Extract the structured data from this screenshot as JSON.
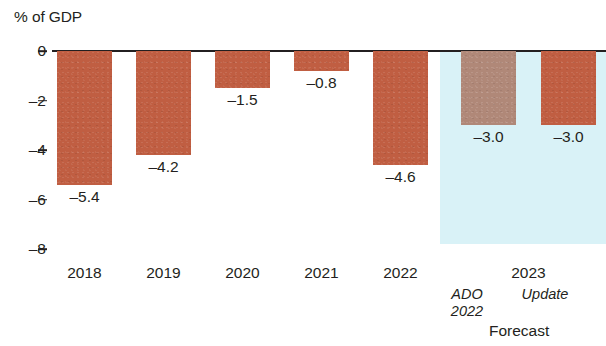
{
  "chart_data": {
    "type": "bar",
    "title": "",
    "ylabel": "% of GDP",
    "xlabel": "",
    "ylim": [
      -8,
      0
    ],
    "grid": false,
    "legend_position": "none",
    "categories": [
      "2018",
      "2019",
      "2020",
      "2021",
      "2022",
      "2023 ADO 2022",
      "2023 Update"
    ],
    "values": [
      -5.4,
      -4.2,
      -1.5,
      -0.8,
      -4.6,
      -3.0,
      -3.0
    ],
    "value_labels": [
      "–5.4",
      "–4.2",
      "–1.5",
      "–0.8",
      "–4.6",
      "–3.0",
      "–3.0"
    ],
    "y_ticks": [
      0,
      -2,
      -4,
      -6,
      -8
    ],
    "y_tick_labels": [
      "0",
      "–2",
      "–4",
      "–6",
      "–8"
    ],
    "bars": [
      {
        "category": "2018",
        "label": "–5.4",
        "value": -5.4,
        "color": "#c05e42",
        "forecast": false
      },
      {
        "category": "2019",
        "label": "–4.2",
        "value": -4.2,
        "color": "#c05e42",
        "forecast": false
      },
      {
        "category": "2020",
        "label": "–1.5",
        "value": -1.5,
        "color": "#c05e42",
        "forecast": false
      },
      {
        "category": "2021",
        "label": "–0.8",
        "value": -0.8,
        "color": "#c05e42",
        "forecast": false
      },
      {
        "category": "2022",
        "label": "–4.6",
        "value": -4.6,
        "color": "#c05e42",
        "forecast": false
      },
      {
        "category": "2023 ADO 2022",
        "label": "–3.0",
        "value": -3.0,
        "color": "#b08878",
        "forecast": true
      },
      {
        "category": "2023 Update",
        "label": "–3.0",
        "value": -3.0,
        "color": "#c05e42",
        "forecast": true
      }
    ],
    "x_axis_labels": [
      "2018",
      "2019",
      "2020",
      "2021",
      "2022",
      "2023"
    ],
    "annotations": {
      "ado_line1": "ADO",
      "ado_line2": "2022",
      "update": "Update",
      "forecast": "Forecast"
    },
    "colors": {
      "bar_terracotta": "#c05e42",
      "bar_tan": "#b08878",
      "forecast_band": "#d9f2f7",
      "axis": "#231f20",
      "background": "#ffffff"
    }
  }
}
